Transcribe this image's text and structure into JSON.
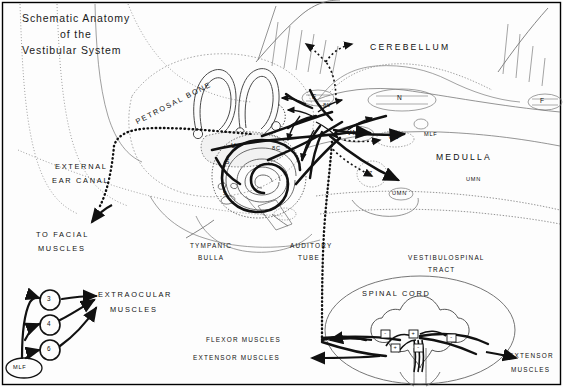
{
  "figure": {
    "title_line1": "Schematic Anatomy",
    "title_line2": "of the",
    "title_line3": "Vestibular System",
    "border_color": "#000000",
    "ink_color": "#111111"
  },
  "regions": {
    "petrosal_bone": "PETROSAL BONE",
    "cerebellum": "CEREBELLUM",
    "medulla": "MEDULLA",
    "external_ear_canal_l1": "EXTERNAL",
    "external_ear_canal_l2": "EAR CANAL",
    "tympanic_bulla_l1": "TYMPANIC",
    "tympanic_bulla_l2": "BULLA",
    "auditory_tube_l1": "AUDITORY",
    "auditory_tube_l2": "TUBE",
    "spinal_cord": "SPINAL CORD",
    "vestibulospinal_l1": "VESTIBULOSPINAL",
    "vestibulospinal_l2": "TRACT"
  },
  "nuclei": {
    "fastigial_left": "F",
    "fastigial_right": "F",
    "interposital": "N",
    "vestibular_nucleus_1": "VN",
    "vestibular_nucleus_2": "VN",
    "mlf_brainstem": "MLF",
    "facial_nucleus": "7",
    "umn_oval": "UMN",
    "umn_medulla": "UMN"
  },
  "labyrinth": {
    "utricle": "U",
    "saccule": "S",
    "ossicle": "S",
    "nerve_vestibular": "8V",
    "nerve_cochlear": "8C"
  },
  "pathways": {
    "to_facial_l1": "TO FACIAL",
    "to_facial_l2": "MUSCLES",
    "extraocular_l1": "EXTRAOCULAR",
    "extraocular_l2": "MUSCLES",
    "flexor_muscles": "FLEXOR MUSCLES",
    "extensor_muscles_left": "EXTENSOR MUSCLES",
    "extensor_muscles_right_l1": "EXTENSOR",
    "extensor_muscles_right_l2": "MUSCLES",
    "mlf_origin": "MLF",
    "cn3": "3",
    "cn4": "4",
    "cn6": "6"
  },
  "synapse_signs": {
    "s1": "-",
    "s2": "+",
    "s3": "+",
    "s4": "-",
    "s5": "-"
  }
}
